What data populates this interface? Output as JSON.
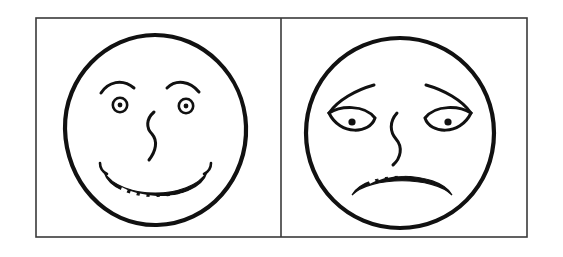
{
  "image": {
    "title": "Two hand-drawn faces: happy and sad",
    "width": 563,
    "height": 257,
    "background_color": "#ffffff",
    "ink_color": "#111111",
    "frame_color": "#3a3a3a",
    "style": "black ink line drawing, no shading"
  },
  "frame": {
    "name": "outer-rectangle",
    "x": 36,
    "y": 18,
    "width": 491,
    "height": 219,
    "stroke_width": 1.6,
    "divider_x": 281,
    "panel_count": 2
  },
  "panels": [
    {
      "id": "left",
      "label": "Happy face panel",
      "face": {
        "name": "happy-face",
        "expression": "happy",
        "emotion_label": "smiling",
        "center_x": 155,
        "center_y": 130,
        "radius_x": 90,
        "radius_y": 95,
        "outline_stroke_width": 4.2,
        "eyebrows": {
          "shape": "upward-arc",
          "left": {
            "start_x": 103,
            "start_y": 92,
            "peak_x": 119,
            "peak_y": 82,
            "end_x": 134,
            "end_y": 87
          },
          "right": {
            "start_x": 168,
            "start_y": 87,
            "peak_x": 183,
            "peak_y": 81,
            "end_x": 198,
            "end_y": 91
          }
        },
        "eyes": {
          "style": "ring-with-center-dot",
          "ring_radius": 7.5,
          "pupil_radius": 2.4,
          "left": {
            "x": 120,
            "y": 104
          },
          "right": {
            "x": 185,
            "y": 105
          }
        },
        "nose": {
          "style": "s-curve-vertical",
          "top_x": 152,
          "top_y": 112,
          "bottom_x": 150,
          "bottom_y": 160
        },
        "mouth": {
          "style": "wide-upward-arc-with-teeth",
          "left_corner_x": 103,
          "right_corner_x": 208,
          "corner_y": 168,
          "lowest_y": 196,
          "teeth_count": 9,
          "teeth_color": "#ffffff"
        }
      }
    },
    {
      "id": "right",
      "label": "Sad face panel",
      "face": {
        "name": "sad-face",
        "expression": "sad",
        "emotion_label": "frowning",
        "center_x": 400,
        "center_y": 133,
        "radius_x": 95,
        "radius_y": 95,
        "outline_stroke_width": 4.2,
        "eyebrows": {
          "shape": "downward-sloping-outward",
          "left": {
            "inner_x": 372,
            "inner_y": 86,
            "outer_x": 330,
            "outer_y": 112
          },
          "right": {
            "inner_x": 428,
            "inner_y": 86,
            "outer_x": 470,
            "outer_y": 112
          }
        },
        "eyes": {
          "style": "almond-with-filled-pupil",
          "pupil_radius": 3.6,
          "left": {
            "x": 352,
            "y": 117,
            "width": 46,
            "height": 24
          },
          "right": {
            "x": 448,
            "y": 117,
            "width": 46,
            "height": 24
          }
        },
        "nose": {
          "style": "s-curve-vertical",
          "top_x": 396,
          "top_y": 113,
          "bottom_x": 400,
          "bottom_y": 165
        },
        "mouth": {
          "style": "wide-downward-arc-with-teeth",
          "left_corner_x": 352,
          "right_corner_x": 452,
          "corner_y": 194,
          "highest_y": 170,
          "teeth_count": 8,
          "teeth_color": "#ffffff"
        }
      }
    }
  ],
  "accessibility": {
    "alt_text": "A rectangle divided into two panels. The left panel contains a hand-drawn smiling face with round eyes, arched eyebrows, an S-shaped nose and a wide grin showing teeth. The right panel contains a hand-drawn sad face with drooping eyebrows, almond eyes with dark pupils, an S-shaped nose, and a downturned frown showing teeth."
  }
}
